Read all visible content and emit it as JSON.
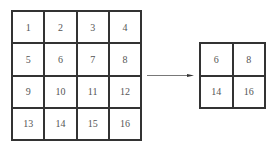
{
  "input_matrix": {
    "rows": 4,
    "cols": 4,
    "cells": [
      "1",
      "2",
      "3",
      "4",
      "5",
      "6",
      "7",
      "8",
      "9",
      "10",
      "11",
      "12",
      "13",
      "14",
      "15",
      "16"
    ]
  },
  "output_matrix": {
    "rows": 2,
    "cols": 2,
    "cells": [
      "6",
      "8",
      "14",
      "16"
    ]
  },
  "arrow": {
    "direction": "right"
  }
}
